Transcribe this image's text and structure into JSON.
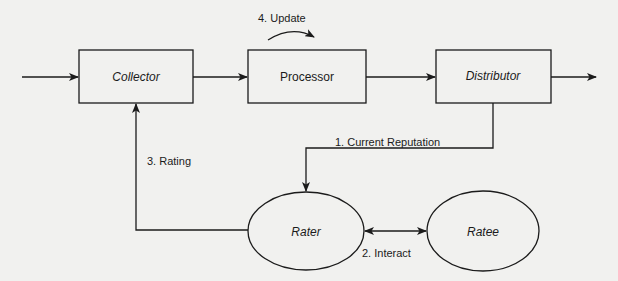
{
  "diagram": {
    "nodes": [
      {
        "id": "collector",
        "label": "Collector",
        "shape": "rectangle"
      },
      {
        "id": "processor",
        "label": "Processor",
        "shape": "rectangle"
      },
      {
        "id": "distributor",
        "label": "Distributor",
        "shape": "rectangle"
      },
      {
        "id": "rater",
        "label": "Rater",
        "shape": "ellipse"
      },
      {
        "id": "ratee",
        "label": "Ratee",
        "shape": "ellipse"
      }
    ],
    "edges": [
      {
        "from": "input",
        "to": "collector",
        "label": ""
      },
      {
        "from": "collector",
        "to": "processor",
        "label": ""
      },
      {
        "from": "processor",
        "to": "processor",
        "label": "4. Update"
      },
      {
        "from": "processor",
        "to": "distributor",
        "label": ""
      },
      {
        "from": "distributor",
        "to": "output",
        "label": ""
      },
      {
        "from": "distributor",
        "to": "rater",
        "label": "1. Current Reputation"
      },
      {
        "from": "rater",
        "to": "ratee",
        "label": "2. Interact",
        "bidirectional": true
      },
      {
        "from": "rater",
        "to": "collector",
        "label": "3. Rating"
      }
    ]
  },
  "labels": {
    "collector": "Collector",
    "processor": "Processor",
    "distributor": "Distributor",
    "rater": "Rater",
    "ratee": "Ratee",
    "update": "4. Update",
    "current_reputation": "1. Current Reputation",
    "interact": "2. Interact",
    "rating": "3. Rating"
  },
  "colors": {
    "background": "#f1f1ef",
    "stroke": "#1b1b1b"
  }
}
